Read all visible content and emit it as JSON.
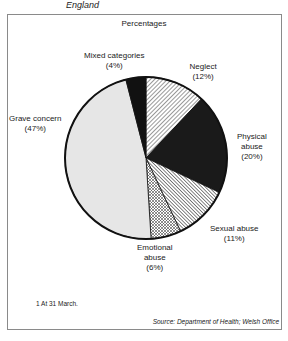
{
  "header": {
    "region": "England",
    "units": "Percentages"
  },
  "chart_data": {
    "type": "pie",
    "title": "",
    "units": "Percentages",
    "direction": "clockwise-from-top",
    "slices": [
      {
        "label": "Neglect",
        "value": 12,
        "value_label": "(12%)",
        "fill": "hatch-diag-light",
        "label_lines": [
          "Neglect",
          "(12%)"
        ]
      },
      {
        "label": "Physical abuse",
        "value": 20,
        "value_label": "(20%)",
        "fill": "#1a1a1a",
        "label_lines": [
          "Physical",
          "abuse",
          "(20%)"
        ]
      },
      {
        "label": "Sexual abuse",
        "value": 11,
        "value_label": "(11%)",
        "fill": "hatch-diag-dense",
        "label_lines": [
          "Sexual abuse",
          "(11%)"
        ]
      },
      {
        "label": "Emotional abuse",
        "value": 6,
        "value_label": "(6%)",
        "fill": "crosshatch",
        "label_lines": [
          "Emotional",
          "abuse",
          "(6%)"
        ]
      },
      {
        "label": "Grave concern",
        "value": 47,
        "value_label": "(47%)",
        "fill": "#e6e6e6",
        "label_lines": [
          "Grave concern",
          "(47%)"
        ]
      },
      {
        "label": "Mixed categories",
        "value": 4,
        "value_label": "(4%)",
        "fill": "#111111",
        "label_lines": [
          "Mixed categories",
          "(4%)"
        ]
      }
    ]
  },
  "footer": {
    "footnote": "1  At 31 March.",
    "source": "Source: Department of Health; Welsh Office"
  }
}
